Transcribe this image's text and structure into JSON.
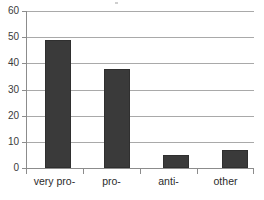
{
  "chart_data": {
    "type": "bar",
    "title": "",
    "subtitle": "",
    "xlabel": "",
    "ylabel": "",
    "categories": [
      "very pro-",
      "pro-",
      "anti-",
      "other"
    ],
    "values": [
      49,
      38,
      5,
      7
    ],
    "series": [
      {
        "name": "",
        "values": [
          49,
          38,
          5,
          7
        ]
      }
    ],
    "ylim": [
      0,
      60
    ],
    "ytick_labels": [
      "0",
      "10",
      "20",
      "30",
      "40",
      "50",
      "60"
    ],
    "ytick_values": [
      0,
      10,
      20,
      30,
      40,
      50,
      60
    ],
    "grid": "horizontal",
    "legend": "none",
    "colors": {
      "bar_fill": "#3a3a3a",
      "bar_edge": "#2f2f2f",
      "gridline": "#a9a9a9",
      "axis_line": "#8c8c8c",
      "tick_label": "#3a3a3a",
      "category_label": "#2b2b2b",
      "background": "#ffffff"
    }
  }
}
